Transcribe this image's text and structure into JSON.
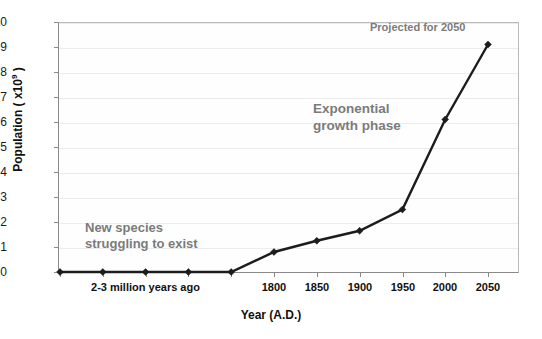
{
  "chart_data": {
    "type": "line",
    "title": "",
    "xlabel": "Year (A.D.)",
    "ylabel": "Population ( x10⁹ )",
    "ylabel_base": "Population ( x10",
    "ylabel_exp": "9",
    "ylabel_tail": " )",
    "ylim": [
      0,
      10
    ],
    "yticks": [
      0,
      1,
      2,
      3,
      4,
      5,
      6,
      7,
      8,
      9,
      10
    ],
    "ytick_labels": [
      "0",
      "1",
      "2",
      "3",
      "4",
      "5",
      "6",
      "7",
      "8",
      "9",
      "10"
    ],
    "grid": true,
    "legend": "none",
    "categories": [
      "",
      "",
      "",
      "",
      "",
      "1800",
      "1850",
      "1900",
      "1950",
      "2000",
      "2050"
    ],
    "xtick_labels": [
      "1800",
      "1850",
      "1900",
      "1950",
      "2000",
      "2050"
    ],
    "x_group_label": "2-3 million years ago",
    "series": [
      {
        "name": "World population",
        "values": [
          0.0,
          0.0,
          0.0,
          0.0,
          0.0,
          0.8,
          1.25,
          1.65,
          2.5,
          6.1,
          9.1
        ],
        "color": "#1c1c1c",
        "marker": "diamond"
      }
    ],
    "annotations": [
      {
        "id": "new-species",
        "text": "New species\nstruggling to exist",
        "color": "#7b7b7b"
      },
      {
        "id": "exponential",
        "text": "Exponential\ngrowth phase",
        "color": "#7b7b7b"
      },
      {
        "id": "projected",
        "text": "Projected for 2050",
        "color": "#7b7b7b"
      }
    ]
  },
  "colors": {
    "background": "#ffffff",
    "plot_background": "#fefefe",
    "axis": "#8a8a8a",
    "gridline": "#ececec",
    "series": "#1c1c1c",
    "annotation_text": "#7b7b7b",
    "tick_text": "#1a1a1a",
    "title_text": "#111111"
  }
}
